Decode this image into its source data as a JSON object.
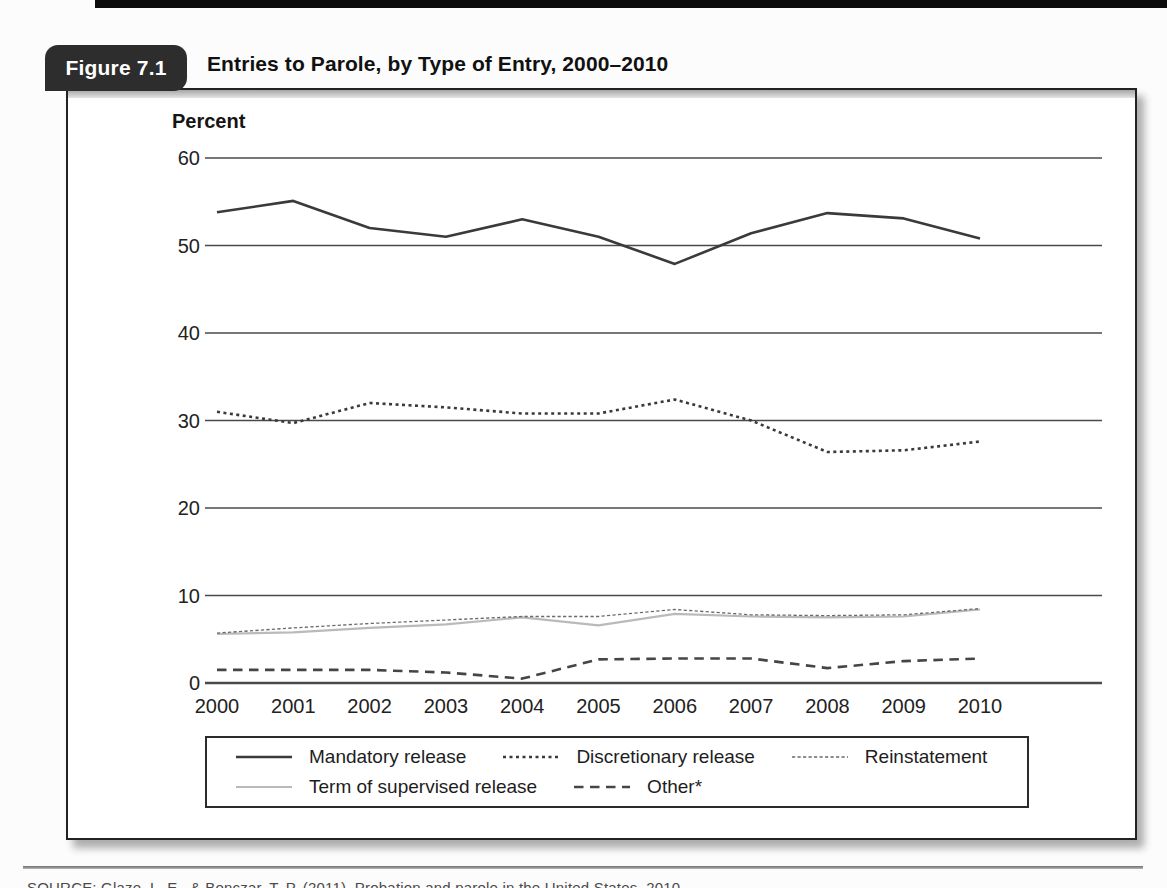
{
  "figure": {
    "badge_label": "Figure 7.1",
    "title": "Entries to Parole, by Type of Entry, 2000–2010"
  },
  "chart_data": {
    "type": "line",
    "title": "Entries to Parole, by Type of Entry, 2000–2010",
    "ylabel": "Percent",
    "xlabel": "",
    "x": [
      2000,
      2001,
      2002,
      2003,
      2004,
      2005,
      2006,
      2007,
      2008,
      2009,
      2010
    ],
    "ylim": [
      0,
      60
    ],
    "yticks": [
      0,
      10,
      20,
      30,
      40,
      50,
      60
    ],
    "grid": true,
    "legend_position": "bottom",
    "series": [
      {
        "name": "Mandatory release",
        "style": "solid",
        "color": "#3a3a3a",
        "width": 2.6,
        "values": [
          53.8,
          55.1,
          52.0,
          51.0,
          53.0,
          51.0,
          47.9,
          51.4,
          53.7,
          53.1,
          50.8
        ]
      },
      {
        "name": "Discretionary release",
        "style": "dotted",
        "color": "#3a3a3a",
        "width": 2.6,
        "values": [
          31.0,
          29.7,
          32.0,
          31.5,
          30.8,
          30.8,
          32.4,
          30.0,
          26.4,
          26.6,
          27.6
        ]
      },
      {
        "name": "Reinstatement",
        "style": "fine-dotted",
        "color": "#6a6a6a",
        "width": 1.3,
        "values": [
          5.7,
          6.3,
          6.8,
          7.2,
          7.6,
          7.6,
          8.4,
          7.8,
          7.7,
          7.8,
          8.5
        ]
      },
      {
        "name": "Term of supervised release",
        "style": "solid",
        "color": "#bababa",
        "width": 2.2,
        "values": [
          5.6,
          5.8,
          6.3,
          6.7,
          7.5,
          6.6,
          7.9,
          7.6,
          7.5,
          7.6,
          8.4
        ]
      },
      {
        "name": "Other*",
        "style": "dashed",
        "color": "#454545",
        "width": 2.6,
        "values": [
          1.5,
          1.5,
          1.5,
          1.2,
          0.5,
          2.7,
          2.8,
          2.8,
          1.7,
          2.5,
          2.8
        ]
      }
    ]
  },
  "source_note": "SOURCE: Glaze, L. E., & Bonczar, T. P. (2011). Probation and parole in the United States, 2010."
}
